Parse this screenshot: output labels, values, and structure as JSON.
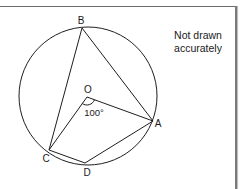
{
  "diagram": {
    "note": {
      "line1": "Not drawn",
      "line2": "accurately"
    },
    "circle": {
      "cx": 88,
      "cy": 96,
      "r": 69
    },
    "points": {
      "A": {
        "label": "A",
        "x": 153,
        "y": 121,
        "lx": 158,
        "ly": 127
      },
      "B": {
        "label": "B",
        "x": 82,
        "y": 28,
        "lx": 81,
        "ly": 24
      },
      "C": {
        "label": "C",
        "x": 49,
        "y": 150,
        "lx": 45,
        "ly": 161
      },
      "D": {
        "label": "D",
        "x": 85,
        "y": 163,
        "lx": 87,
        "ly": 175
      },
      "O": {
        "label": "O",
        "x": 87,
        "y": 97,
        "lx": 88,
        "ly": 92
      }
    },
    "segments": [
      "AB",
      "BC",
      "OA",
      "OC",
      "AD",
      "CD"
    ],
    "angle": {
      "at": "O",
      "between": "AOC",
      "label": "100°"
    },
    "colors": {
      "line": "#1e1e1e",
      "text": "#1a1a1a",
      "frame": "#6a6a6a"
    }
  }
}
